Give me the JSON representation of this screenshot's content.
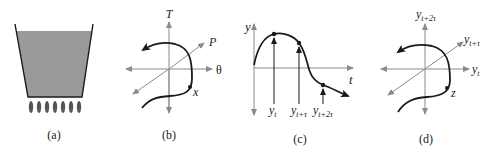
{
  "figure": {
    "panels": [
      {
        "id": "a",
        "caption": "(a)",
        "description": "Heated liquid container",
        "colors": {
          "liquid": "#9a9a9a",
          "wall": "#1a1a1a",
          "flame": "#555555"
        },
        "flame_count": 7
      },
      {
        "id": "b",
        "caption": "(b)",
        "axes": {
          "vertical": "T",
          "diagonal": "P",
          "horizontal": "θ"
        },
        "point_label": "x"
      },
      {
        "id": "c",
        "caption": "(c)",
        "axes": {
          "vertical": "y",
          "horizontal": "t"
        },
        "samples": [
          {
            "base": "y",
            "sub": "t"
          },
          {
            "base": "y",
            "sub": "t+τ"
          },
          {
            "base": "y",
            "sub": "t+2τ"
          }
        ]
      },
      {
        "id": "d",
        "caption": "(d)",
        "axes": {
          "vertical": {
            "base": "y",
            "sub": "t+2τ"
          },
          "diagonal": {
            "base": "y",
            "sub": "t+τ"
          },
          "horizontal": {
            "base": "y",
            "sub": "t"
          }
        },
        "point_label": "z"
      }
    ],
    "colors": {
      "axis": "#8a8a8a",
      "curve": "#1a1a1a"
    }
  }
}
